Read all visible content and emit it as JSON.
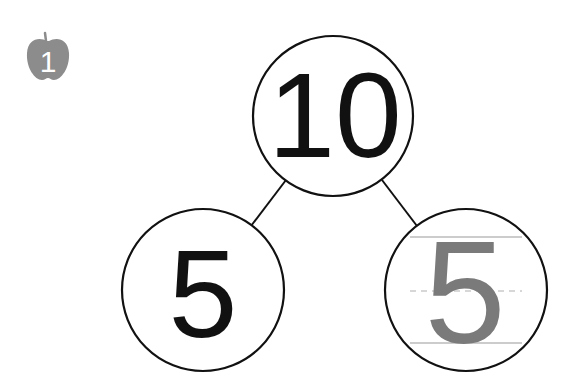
{
  "problem": {
    "number": "1",
    "icon": "apple-icon",
    "icon_color": "#8c8c8c"
  },
  "number_bond": {
    "whole": "10",
    "parts": [
      {
        "value": "5",
        "style": "printed",
        "color": "#111111"
      },
      {
        "value": "5",
        "style": "tracing",
        "color": "#7a7a7a"
      }
    ],
    "line_color": "#111111",
    "guide_line_color": "#9a9a9a"
  }
}
